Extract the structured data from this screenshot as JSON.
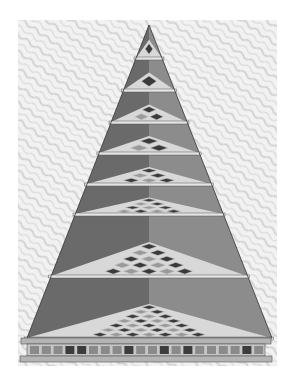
{
  "image": {
    "subject": "Engraving of a stepped pyramid with checkered tiled floors on each tier",
    "background_color": "#ffffff",
    "paper_color": "#ececec",
    "colors": {
      "left_face": "#6a6a6a",
      "right_face": "#8c8c8c",
      "shelf": "#d8d8d8",
      "tile_dark": "#3a3a3a",
      "tile_light": "#9a9a9a",
      "base": "#b4b4b4"
    },
    "tiers": [
      {
        "y": 58,
        "rows": 1
      },
      {
        "y": 90,
        "rows": 1
      },
      {
        "y": 122,
        "rows": 2
      },
      {
        "y": 153,
        "rows": 2
      },
      {
        "y": 184,
        "rows": 3
      },
      {
        "y": 214,
        "rows": 4
      },
      {
        "y": 276,
        "rows": 5
      },
      {
        "y": 338,
        "rows": 7
      }
    ]
  }
}
